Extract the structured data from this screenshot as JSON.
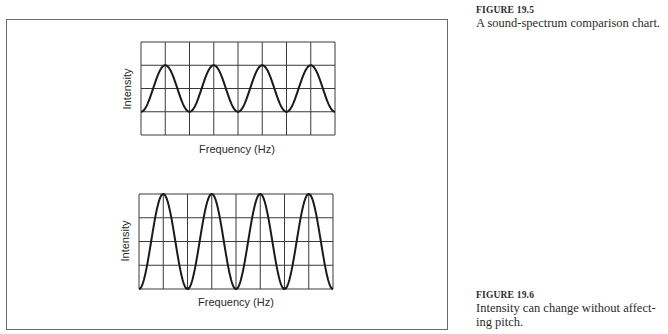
{
  "figures": [
    {
      "number": "FIGURE 19.5",
      "caption": "A sound-spectrum comparison chart."
    },
    {
      "number": "FIGURE 19.6",
      "caption_line1": "Intensity can change without affect-",
      "caption_line2": "ing pitch."
    }
  ],
  "chart_data": [
    {
      "type": "line",
      "title": "",
      "xlabel": "Frequency (Hz)",
      "ylabel": "Intensity",
      "grid": true,
      "grid_columns": 8,
      "grid_rows": 4,
      "waveform": "sine",
      "cycles": 4,
      "x": [
        0,
        1,
        2,
        3,
        4,
        5,
        6,
        7,
        8
      ],
      "values": [
        1,
        3,
        1,
        3,
        1,
        3,
        1,
        3,
        1
      ],
      "ylim": [
        0,
        4
      ],
      "legend": "none",
      "note": "y in grid-row units; peaks at 3, troughs at 1 (lower amplitude)"
    },
    {
      "type": "line",
      "title": "",
      "xlabel": "Frequency (Hz)",
      "ylabel": "Intensity",
      "grid": true,
      "grid_columns": 8,
      "grid_rows": 4,
      "waveform": "sine",
      "cycles": 4,
      "x": [
        0,
        1,
        2,
        3,
        4,
        5,
        6,
        7,
        8
      ],
      "values": [
        0,
        4,
        0,
        4,
        0,
        4,
        0,
        4,
        0
      ],
      "ylim": [
        0,
        4
      ],
      "legend": "none",
      "note": "y in grid-row units; peaks at 4, troughs at 0 (higher amplitude, same frequency)"
    }
  ]
}
